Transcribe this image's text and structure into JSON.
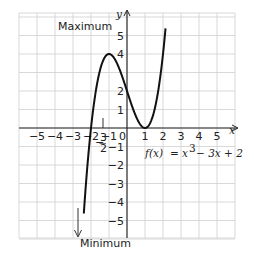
{
  "chart_data": {
    "type": "line",
    "title": "",
    "equation_label": "f(x) = x³ − 3x + 2",
    "equation_parts": {
      "lhs": "f(x)",
      "eq": "=",
      "x": "x",
      "exp": "3",
      "rest": "− 3x + 2"
    },
    "xlabel": "x",
    "ylabel": "y",
    "xlim": [
      -6,
      6
    ],
    "ylim": [
      -6,
      6.2
    ],
    "grid": true,
    "x_ticks": [
      -5,
      -4,
      -3,
      -2,
      -1,
      1,
      2,
      3,
      4,
      5
    ],
    "x_tick_labels": [
      "−5",
      "−4",
      "−3",
      "−2",
      "−1",
      "1",
      "2",
      "3",
      "4",
      "5"
    ],
    "origin_label": "0",
    "y_ticks": [
      5,
      4,
      2,
      1,
      -1,
      -2,
      -3,
      -4,
      -5
    ],
    "y_tick_labels": [
      "5",
      "4",
      "2",
      "1",
      "−1",
      "−2",
      "−3",
      "−4",
      "−5"
    ],
    "series": [
      {
        "name": "f(x) = x^3 - 3x + 2",
        "x": [
          -2.35,
          -2,
          -1.5,
          -1,
          -0.5,
          0,
          0.5,
          1,
          1.5,
          2,
          2.1
        ],
        "y": [
          -3.93,
          0,
          2.625,
          4,
          3.375,
          2,
          0.625,
          0,
          0.875,
          4,
          4.96
        ]
      }
    ],
    "annotations": [
      {
        "text": "Maximum",
        "point": [
          -1,
          4
        ]
      },
      {
        "text": "Minimum",
        "point": [
          1,
          0
        ]
      },
      {
        "text": "−¾/2 marker",
        "fraction_num": "3",
        "fraction_den": "2",
        "fraction_sign": "−",
        "x": -1.5
      }
    ]
  },
  "labels": {
    "maximum": "Maximum",
    "minimum": "Minimum",
    "x_axis": "x",
    "y_axis": "y",
    "frac_sign": "−",
    "frac_num": "3",
    "frac_den": "2",
    "eq_lhs": "f(x)",
    "eq_equals": "=",
    "eq_x": "x",
    "eq_exp": "3",
    "eq_rest": "−  3x  +  2",
    "origin": "0"
  }
}
